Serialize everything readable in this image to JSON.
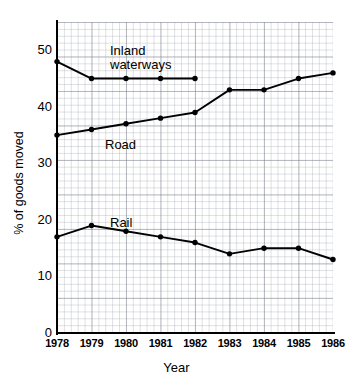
{
  "chart_data": {
    "type": "line",
    "title": "",
    "xlabel": "Year",
    "ylabel": "% of goods moved",
    "categories": [
      "1978",
      "1979",
      "1980",
      "1981",
      "1982",
      "1983",
      "1984",
      "1985",
      "1986"
    ],
    "x": [
      1978,
      1979,
      1980,
      1981,
      1982,
      1983,
      1984,
      1985,
      1986
    ],
    "xlim": [
      1978,
      1986
    ],
    "ylim": [
      0,
      55
    ],
    "y_ticks": [
      0,
      10,
      20,
      30,
      40,
      50
    ],
    "grid": true,
    "legend_position": "inline-annotations",
    "series": [
      {
        "name": "Inland waterways",
        "label_lines": [
          "Inland",
          "waterways"
        ],
        "marker": "filled-circle",
        "color": "#000000",
        "x": [
          1978,
          1979,
          1980,
          1981,
          1982
        ],
        "values": [
          48,
          45,
          45,
          45,
          45
        ]
      },
      {
        "name": "Road",
        "label_lines": [
          "Road"
        ],
        "marker": "filled-circle",
        "color": "#000000",
        "x": [
          1978,
          1979,
          1980,
          1981,
          1982,
          1983,
          1984,
          1985,
          1986
        ],
        "values": [
          35,
          36,
          37,
          38,
          39,
          43,
          43,
          45,
          46
        ]
      },
      {
        "name": "Rail",
        "label_lines": [
          "Rail"
        ],
        "marker": "filled-circle",
        "color": "#000000",
        "x": [
          1978,
          1979,
          1980,
          1981,
          1982,
          1983,
          1984,
          1985,
          1986
        ],
        "values": [
          17,
          19,
          18,
          17,
          16,
          14,
          15,
          15,
          13
        ]
      }
    ],
    "annotations": [
      {
        "text": "Inland",
        "x_px": 110,
        "y_px": 44
      },
      {
        "text": "waterways",
        "x_px": 110,
        "y_px": 58
      },
      {
        "text": "Road",
        "x_px": 105,
        "y_px": 138
      },
      {
        "text": "Rail",
        "x_px": 110,
        "y_px": 216
      }
    ],
    "axis_colors": {
      "axis": "#000000",
      "grid_major": "#787d87",
      "grid_minor": "#969ba5",
      "series": "#000000"
    }
  }
}
